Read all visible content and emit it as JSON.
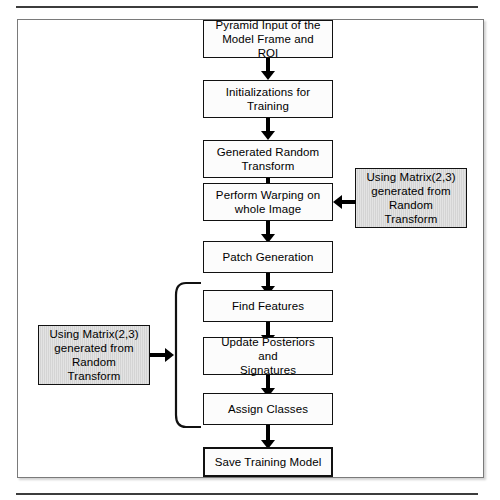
{
  "diagram": {
    "title_text": "",
    "frame": {
      "present": true
    },
    "colors": {
      "node_fill": "#fcfcfc",
      "note_fill": "#d4d4d4",
      "stroke": "#111111",
      "frame_stroke": "#7a7a7a",
      "rule": "#3c3c3c"
    },
    "nodes": [
      {
        "id": "pyramid-input",
        "label": "Pyramid Input of the\nModel Frame and ROI",
        "line1": "Pyramid Input of the",
        "line2": "Model Frame and ROI",
        "style": "plain"
      },
      {
        "id": "initializations",
        "label": "Initializations for\nTraining",
        "line1": "Initializations for",
        "line2": "Training",
        "style": "plain"
      },
      {
        "id": "generated-random",
        "label": "Generated Random\nTransform",
        "line1": "Generated Random",
        "line2": "Transform",
        "style": "plain"
      },
      {
        "id": "perform-warping",
        "label": "Perform Warping on\nwhole Image",
        "line1": "Perform Warping on",
        "line2": "whole Image",
        "style": "plain"
      },
      {
        "id": "patch-generation",
        "label": "Patch Generation",
        "line1": "Patch Generation",
        "line2": "",
        "style": "plain"
      },
      {
        "id": "find-features",
        "label": "Find Features",
        "line1": "Find Features",
        "line2": "",
        "style": "plain"
      },
      {
        "id": "update-posteriors",
        "label": "Update Posteriors and\nSignatures",
        "line1": "Update Posteriors and",
        "line2": "Signatures",
        "style": "plain"
      },
      {
        "id": "assign-classes",
        "label": "Assign Classes",
        "line1": "Assign Classes",
        "line2": "",
        "style": "plain"
      },
      {
        "id": "save-training-model",
        "label": "Save Training Model",
        "line1": "Save Training Model",
        "line2": "",
        "style": "plain-thick"
      }
    ],
    "notes": [
      {
        "id": "note-right",
        "position": "right",
        "line1": "Using Matrix(2,3)",
        "line2": "generated from",
        "line3": "Random",
        "line4": "Transform",
        "target": "perform-warping"
      },
      {
        "id": "note-left",
        "position": "left",
        "line1": "Using Matrix(2,3)",
        "line2": "generated from",
        "line3": "Random",
        "line4": "Transform",
        "target": "iteration-bracket"
      }
    ],
    "bracket": {
      "id": "iteration-bracket",
      "spans": [
        "find-features",
        "update-posteriors",
        "assign-classes"
      ]
    },
    "arrows": [
      {
        "from": "pyramid-input",
        "to": "initializations",
        "direction": "down"
      },
      {
        "from": "initializations",
        "to": "generated-random",
        "direction": "down"
      },
      {
        "from": "generated-random",
        "to": "perform-warping",
        "direction": "down"
      },
      {
        "from": "perform-warping",
        "to": "patch-generation",
        "direction": "down"
      },
      {
        "from": "patch-generation",
        "to": "find-features",
        "direction": "down"
      },
      {
        "from": "find-features",
        "to": "update-posteriors",
        "direction": "down"
      },
      {
        "from": "update-posteriors",
        "to": "assign-classes",
        "direction": "down"
      },
      {
        "from": "assign-classes",
        "to": "save-training-model",
        "direction": "down"
      },
      {
        "from": "note-right",
        "to": "perform-warping",
        "direction": "left"
      },
      {
        "from": "note-left",
        "to": "iteration-bracket",
        "direction": "right"
      }
    ]
  }
}
